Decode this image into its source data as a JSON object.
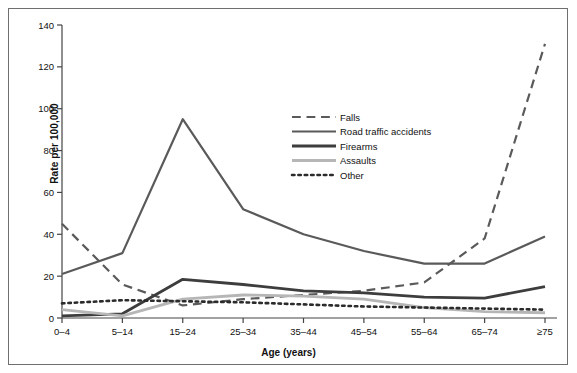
{
  "figure": {
    "background": "#ffffff",
    "frame_color": "#6f6f6f"
  },
  "axis": {
    "y_title": "Rate per 100,000",
    "x_title": "Age (years)"
  },
  "chart_data": {
    "type": "line",
    "title": "",
    "xlabel": "Age (years)",
    "ylabel": "Rate per 100,000",
    "categories": [
      "0–4",
      "5–14",
      "15–24",
      "25–34",
      "35–44",
      "45–54",
      "55–64",
      "65–74",
      "≥75"
    ],
    "ylim": [
      0,
      140
    ],
    "yticks": [
      0,
      20,
      40,
      60,
      80,
      100,
      120,
      140
    ],
    "ytick_labels": [
      "0",
      "20",
      "40",
      "60",
      "80",
      "100",
      "120",
      "140"
    ],
    "grid": false,
    "legend_position": "upper center",
    "series": [
      {
        "name": "Falls",
        "values": [
          45,
          16,
          6,
          9,
          11,
          13,
          17,
          38,
          131
        ],
        "color": "#5a5a5a",
        "style": "dashed",
        "width": 2.2
      },
      {
        "name": "Road traffic accidents",
        "values": [
          21,
          31,
          95,
          52,
          40,
          32,
          26,
          26,
          39
        ],
        "color": "#5a5a5a",
        "style": "solid",
        "width": 2.2
      },
      {
        "name": "Firearms",
        "values": [
          1,
          2,
          18.5,
          16,
          13,
          12,
          10,
          9.5,
          15
        ],
        "color": "#3d3d3d",
        "style": "solid",
        "width": 2.8
      },
      {
        "name": "Assaults",
        "values": [
          4,
          1,
          9,
          11,
          10.5,
          9,
          5,
          3,
          2.5
        ],
        "color": "#b6b6b6",
        "style": "solid",
        "width": 2.8
      },
      {
        "name": "Other",
        "values": [
          7,
          8.5,
          8,
          7.5,
          6.5,
          5.5,
          5,
          4.5,
          4
        ],
        "color": "#2b2b2b",
        "style": "dotted",
        "width": 2.6
      }
    ]
  },
  "legend": {
    "items": [
      {
        "label": "Falls"
      },
      {
        "label": "Road traffic accidents"
      },
      {
        "label": "Firearms"
      },
      {
        "label": "Assaults"
      },
      {
        "label": "Other"
      }
    ]
  }
}
